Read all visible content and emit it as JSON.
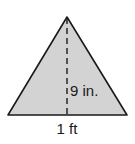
{
  "figure": {
    "shape": "triangle",
    "fill_color": "#d3d3d3",
    "stroke_color": "#1a1a1a",
    "height_label": "9 in.",
    "base_label": "1 ft"
  }
}
